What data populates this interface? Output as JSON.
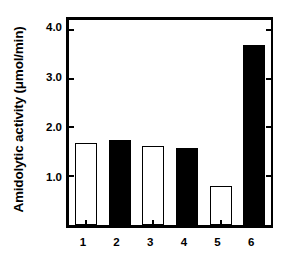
{
  "chart_data": {
    "type": "bar",
    "title": "",
    "xlabel": "",
    "ylabel": "Amidolytic activity (μmol/min)",
    "categories": [
      "1",
      "2",
      "3",
      "4",
      "5",
      "6"
    ],
    "values": [
      1.68,
      1.74,
      1.62,
      1.58,
      0.8,
      3.68
    ],
    "bar_styles": [
      "open",
      "filled",
      "open",
      "filled",
      "open",
      "filled"
    ],
    "ylim": [
      0.0,
      4.2
    ],
    "ytick_values": [
      1.0,
      2.0,
      3.0,
      4.0
    ],
    "ytick_labels": [
      "1.0",
      "2.0",
      "3.0",
      "4.0"
    ],
    "grid": false,
    "legend": null,
    "colors": {
      "open_fill": "#ffffff",
      "filled_fill": "#000000",
      "axis": "#000000",
      "background": "#ffffff"
    }
  }
}
